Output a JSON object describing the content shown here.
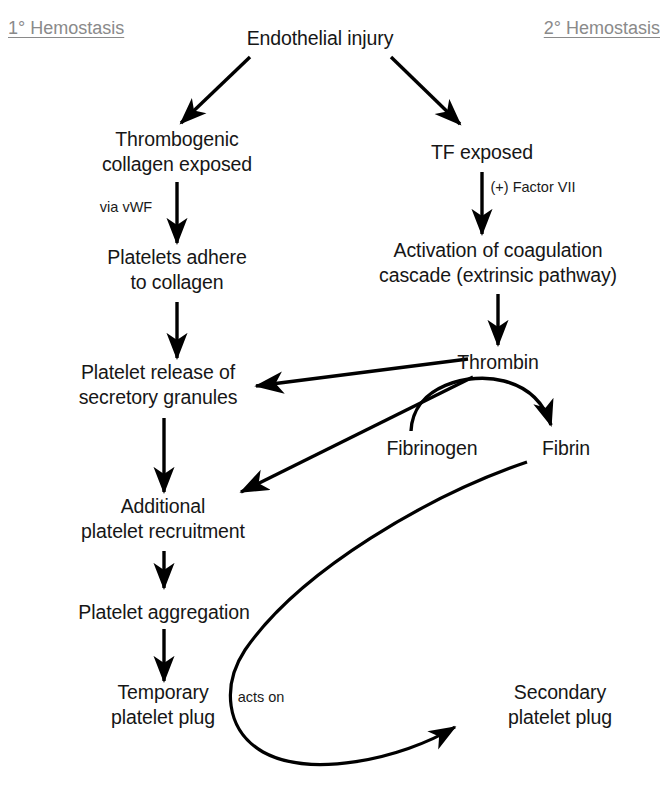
{
  "diagram": {
    "background_color": "#ffffff",
    "line_color": "#000000",
    "text_color": "#161616",
    "section_label_color": "#8a8a8a"
  },
  "sections": [
    {
      "name": "primary",
      "label": "1° Hemostasis",
      "x": 8,
      "y": 28,
      "align": "left"
    },
    {
      "name": "secondary",
      "label": "2° Hemostasis",
      "x": 660,
      "y": 28,
      "align": "right"
    }
  ],
  "nodes": [
    {
      "id": "endothelial_injury",
      "label": "Endothelial injury",
      "x": 320,
      "y": 38
    },
    {
      "id": "collagen_exposed",
      "label": "Thrombogenic\ncollagen exposed",
      "x": 177,
      "y": 152
    },
    {
      "id": "tf_exposed",
      "label": "TF exposed",
      "x": 482,
      "y": 152
    },
    {
      "id": "platelets_adhere",
      "label": "Platelets adhere\nto collagen",
      "x": 177,
      "y": 270
    },
    {
      "id": "coagulation_cascade",
      "label": "Activation of coagulation\ncascade (extrinsic pathway)",
      "x": 498,
      "y": 263
    },
    {
      "id": "platelet_release",
      "label": "Platelet release of\nsecretory granules",
      "x": 158,
      "y": 385
    },
    {
      "id": "thrombin",
      "label": "Thrombin",
      "x": 498,
      "y": 362
    },
    {
      "id": "fibrinogen",
      "label": "Fibrinogen",
      "x": 432,
      "y": 448
    },
    {
      "id": "fibrin",
      "label": "Fibrin",
      "x": 566,
      "y": 448
    },
    {
      "id": "additional_platelet",
      "label": "Additional\nplatelet recruitment",
      "x": 163,
      "y": 519
    },
    {
      "id": "platelet_aggregation",
      "label": "Platelet aggregation",
      "x": 164,
      "y": 612
    },
    {
      "id": "temporary_plug",
      "label": "Temporary\nplatelet plug",
      "x": 163,
      "y": 705
    },
    {
      "id": "secondary_plug",
      "label": "Secondary\nplatelet plug",
      "x": 560,
      "y": 705
    }
  ],
  "edge_labels": [
    {
      "id": "via_vwf",
      "label": "via vWF",
      "x": 126,
      "y": 207
    },
    {
      "id": "factor_vii",
      "label": "(+) Factor VII",
      "x": 533,
      "y": 187
    },
    {
      "id": "acts_on",
      "label": "acts on",
      "x": 261,
      "y": 697
    }
  ],
  "edges": [
    {
      "id": "injury-to-collagen",
      "from": "endothelial_injury",
      "to": "collagen_exposed",
      "type": "straight"
    },
    {
      "id": "injury-to-tf",
      "from": "endothelial_injury",
      "to": "tf_exposed",
      "type": "straight"
    },
    {
      "id": "collagen-to-adhere",
      "from": "collagen_exposed",
      "to": "platelets_adhere",
      "type": "straight",
      "label": "via vWF"
    },
    {
      "id": "tf-to-cascade",
      "from": "tf_exposed",
      "to": "coagulation_cascade",
      "type": "straight",
      "label": "(+) Factor VII"
    },
    {
      "id": "adhere-to-release",
      "from": "platelets_adhere",
      "to": "platelet_release",
      "type": "straight"
    },
    {
      "id": "cascade-to-thrombin",
      "from": "coagulation_cascade",
      "to": "thrombin",
      "type": "straight"
    },
    {
      "id": "thrombin-to-release",
      "from": "thrombin",
      "to": "platelet_release",
      "type": "straight"
    },
    {
      "id": "thrombin-to-additional",
      "from": "thrombin",
      "to": "additional_platelet",
      "type": "straight"
    },
    {
      "id": "fibrinogen-to-fibrin",
      "from": "fibrinogen",
      "to": "fibrin",
      "type": "arc",
      "via": "thrombin"
    },
    {
      "id": "release-to-additional",
      "from": "platelet_release",
      "to": "additional_platelet",
      "type": "straight"
    },
    {
      "id": "additional-to-aggregation",
      "from": "additional_platelet",
      "to": "platelet_aggregation",
      "type": "straight"
    },
    {
      "id": "aggregation-to-temporary",
      "from": "platelet_aggregation",
      "to": "temporary_plug",
      "type": "straight"
    },
    {
      "id": "fibrin-to-secondary",
      "from": "fibrin",
      "to": "secondary_plug",
      "type": "curve",
      "label": "acts on"
    }
  ]
}
